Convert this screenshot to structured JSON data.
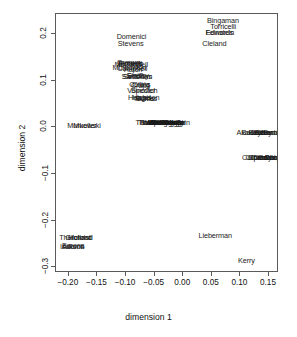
{
  "chart_data": {
    "type": "scatter",
    "title": "",
    "xlabel": "dimension 1",
    "ylabel": "dimension 2",
    "xlim": [
      -0.2225,
      0.1675
    ],
    "ylim": [
      -0.3125,
      0.2425
    ],
    "xticks": [
      -0.2,
      -0.15,
      -0.1,
      -0.05,
      0.0,
      0.05,
      0.1,
      0.15
    ],
    "xticklabels": [
      "-0.20",
      "-0.15",
      "-0.10",
      "-0.05",
      "0.00",
      "0.05",
      "0.10",
      "0.15"
    ],
    "yticks": [
      0.2,
      0.1,
      0.0,
      -0.1,
      -0.2,
      -0.3
    ],
    "yticklabels": [
      "0.2",
      "0.1",
      "0.0",
      "-0.1",
      "-0.2",
      "-0.3"
    ],
    "grid": false,
    "legend": false,
    "marker": "text-label",
    "points": [
      {
        "label": "Bingaman",
        "x": 0.0695,
        "y": 0.227
      },
      {
        "label": "Torricelli",
        "x": 0.07,
        "y": 0.215
      },
      {
        "label": "Feinstein",
        "x": 0.064,
        "y": 0.202
      },
      {
        "label": "Edwards",
        "x": 0.0635,
        "y": 0.201
      },
      {
        "label": "Cleland",
        "x": 0.0545,
        "y": 0.179
      },
      {
        "label": "Domenici",
        "x": -0.0905,
        "y": 0.1935
      },
      {
        "label": "Stevens",
        "x": -0.092,
        "y": 0.179
      },
      {
        "label": "Gramm",
        "x": -0.0955,
        "y": 0.137
      },
      {
        "label": "Bennett",
        "x": -0.093,
        "y": 0.136
      },
      {
        "label": "Roberts",
        "x": -0.0915,
        "y": 0.1345
      },
      {
        "label": "McConnell",
        "x": -0.091,
        "y": 0.133
      },
      {
        "label": "Murkowski",
        "x": -0.0945,
        "y": 0.127
      },
      {
        "label": "Campbell",
        "x": -0.089,
        "y": 0.125
      },
      {
        "label": "Hatch",
        "x": -0.088,
        "y": 0.123
      },
      {
        "label": "Kyl",
        "x": -0.083,
        "y": 0.133
      },
      {
        "label": "Smith",
        "x": -0.0835,
        "y": 0.11
      },
      {
        "label": "Shelby",
        "x": -0.079,
        "y": 0.109
      },
      {
        "label": "Santorum",
        "x": -0.081,
        "y": 0.108
      },
      {
        "label": "Sessions",
        "x": -0.08,
        "y": 0.107
      },
      {
        "label": "Collins",
        "x": -0.076,
        "y": 0.091
      },
      {
        "label": "Craig",
        "x": -0.074,
        "y": 0.0895
      },
      {
        "label": "Crapo",
        "x": -0.0745,
        "y": 0.088
      },
      {
        "label": "Specter",
        "x": -0.07,
        "y": 0.077
      },
      {
        "label": "Voinovich",
        "x": -0.0715,
        "y": 0.078
      },
      {
        "label": "Hutchison",
        "x": -0.069,
        "y": 0.062
      },
      {
        "label": "Hagel",
        "x": -0.073,
        "y": 0.0615
      },
      {
        "label": "Burns",
        "x": -0.067,
        "y": 0.061
      },
      {
        "label": "Nickles",
        "x": -0.0655,
        "y": 0.0605
      },
      {
        "label": "Murkowski",
        "x": -0.1735,
        "y": 0.003
      },
      {
        "label": "Mueller",
        "x": -0.172,
        "y": 0.0025
      },
      {
        "label": "Thomas",
        "x": -0.0565,
        "y": 0.01
      },
      {
        "label": "Thompson",
        "x": -0.054,
        "y": 0.0098
      },
      {
        "label": "Warner",
        "x": -0.0515,
        "y": 0.0096
      },
      {
        "label": "Allard",
        "x": -0.049,
        "y": 0.0094
      },
      {
        "label": "Allen",
        "x": -0.0465,
        "y": 0.0092
      },
      {
        "label": "Brownback",
        "x": -0.044,
        "y": 0.009
      },
      {
        "label": "Bond",
        "x": -0.0415,
        "y": 0.0088
      },
      {
        "label": "Bunning",
        "x": -0.039,
        "y": 0.0086
      },
      {
        "label": "Cochran",
        "x": -0.0365,
        "y": 0.009
      },
      {
        "label": "DeWine",
        "x": -0.034,
        "y": 0.0092
      },
      {
        "label": "Ensign",
        "x": -0.0318,
        "y": 0.0094
      },
      {
        "label": "Enzi",
        "x": -0.0295,
        "y": 0.0096
      },
      {
        "label": "Fitzgerald",
        "x": -0.0272,
        "y": 0.0098
      },
      {
        "label": "Frist",
        "x": -0.025,
        "y": 0.01
      },
      {
        "label": "Grassley",
        "x": -0.0228,
        "y": 0.01
      },
      {
        "label": "Gregg",
        "x": -0.0205,
        "y": 0.01
      },
      {
        "label": "Helms",
        "x": -0.0182,
        "y": 0.01
      },
      {
        "label": "Inhofe",
        "x": -0.016,
        "y": 0.01
      },
      {
        "label": "Lott",
        "x": -0.0138,
        "y": 0.01
      },
      {
        "label": "Lugar",
        "x": -0.0115,
        "y": 0.01
      },
      {
        "label": "McCain",
        "x": -0.0095,
        "y": 0.01
      },
      {
        "label": "Akaka",
        "x": 0.1105,
        "y": -0.0115
      },
      {
        "label": "Baucus",
        "x": 0.123,
        "y": -0.0118
      },
      {
        "label": "Bayh",
        "x": 0.129,
        "y": -0.012
      },
      {
        "label": "Biden",
        "x": 0.135,
        "y": -0.0122
      },
      {
        "label": "Boxer",
        "x": 0.141,
        "y": -0.0124
      },
      {
        "label": "Breaux",
        "x": 0.147,
        "y": -0.0126
      },
      {
        "label": "Byrd",
        "x": 0.153,
        "y": -0.0128
      },
      {
        "label": "Cantwell",
        "x": 0.159,
        "y": -0.013
      },
      {
        "label": "Carper",
        "x": 0.122,
        "y": -0.0655
      },
      {
        "label": "Clinton",
        "x": 0.128,
        "y": -0.0658
      },
      {
        "label": "Conrad",
        "x": 0.134,
        "y": -0.066
      },
      {
        "label": "Corzine",
        "x": 0.14,
        "y": -0.0662
      },
      {
        "label": "Daschle",
        "x": 0.146,
        "y": -0.0664
      },
      {
        "label": "Dayton",
        "x": 0.152,
        "y": -0.0666
      },
      {
        "label": "Dodd",
        "x": 0.158,
        "y": -0.0668
      },
      {
        "label": "Dorgan",
        "x": 0.163,
        "y": -0.067
      },
      {
        "label": "Lieberman",
        "x": 0.056,
        "y": -0.234
      },
      {
        "label": "Kerry",
        "x": 0.1105,
        "y": -0.287
      },
      {
        "label": "Thurmond",
        "x": -0.1885,
        "y": -0.237
      },
      {
        "label": "Gilchrist",
        "x": -0.184,
        "y": -0.2368
      },
      {
        "label": "Holland",
        "x": -0.1795,
        "y": -0.2366
      },
      {
        "label": "Isakson",
        "x": -0.194,
        "y": -0.256
      },
      {
        "label": "Adams",
        "x": -0.193,
        "y": -0.2558
      },
      {
        "label": "Barons",
        "x": -0.1925,
        "y": -0.2556
      }
    ]
  }
}
